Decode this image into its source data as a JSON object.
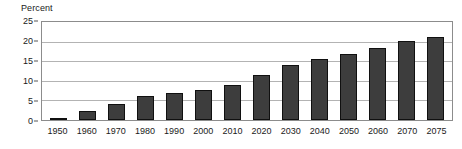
{
  "chart_data": {
    "type": "bar",
    "title": "",
    "xlabel": "",
    "ylabel": "Percent",
    "ylim": [
      0,
      25
    ],
    "yticks": [
      0,
      5,
      10,
      15,
      20,
      25
    ],
    "grid": true,
    "legend": "none",
    "bar_color": "#3d3d3d",
    "categories": [
      "1950",
      "1960",
      "1970",
      "1980",
      "1990",
      "2000",
      "2010",
      "2020",
      "2030",
      "2040",
      "2050",
      "2060",
      "2070",
      "2075"
    ],
    "values": [
      0.4,
      2.3,
      4.0,
      6.0,
      7.0,
      7.7,
      9.0,
      11.4,
      14.0,
      15.5,
      16.8,
      18.3,
      20.2,
      21.3
    ]
  }
}
